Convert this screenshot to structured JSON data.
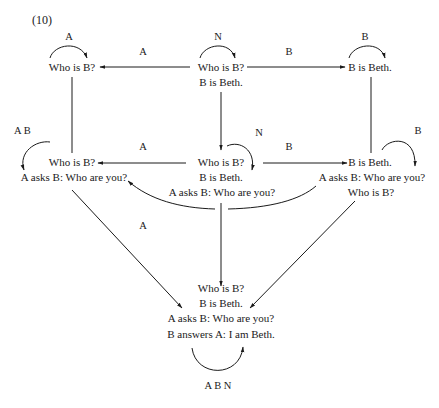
{
  "figure": {
    "number": "(10)"
  },
  "nodes": {
    "top_left": {
      "lines": [
        "Who is B?"
      ],
      "loop_label": "A"
    },
    "top_center": {
      "lines": [
        "Who is B?",
        "B is Beth."
      ],
      "loop_label": "N"
    },
    "top_right": {
      "lines": [
        "B is Beth."
      ],
      "loop_label": "B"
    },
    "mid_left": {
      "lines": [
        "Who is B?",
        "A asks B: Who are you?"
      ],
      "loop_label": "A B"
    },
    "mid_center": {
      "lines": [
        "Who is B?",
        "B is Beth.",
        "A asks B: Who are you?"
      ],
      "loop_label": "N"
    },
    "mid_right": {
      "lines": [
        "B is Beth.",
        "A asks B: Who are you?",
        "Who is B?"
      ],
      "loop_label": "B"
    },
    "bottom": {
      "lines": [
        "Who is B?",
        "B is Beth.",
        "A asks B: Who are you?",
        "B answers A: I am Beth."
      ],
      "loop_label": "A B N"
    }
  },
  "edges": {
    "top_center_to_top_left": "A",
    "top_center_to_top_right": "B",
    "mid_center_to_mid_left": "A",
    "mid_center_to_mid_right": "B",
    "top_center_to_mid_center": "N",
    "mid_center_curve_to_mid_left": "A"
  }
}
